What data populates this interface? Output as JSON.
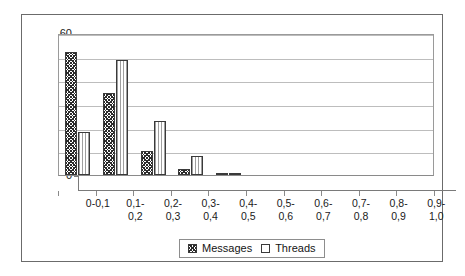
{
  "chart_data": {
    "type": "bar",
    "title": "",
    "xlabel": "",
    "ylabel": "",
    "ylim": [
      0,
      60
    ],
    "ytick_step": 10,
    "yticks": [
      "0",
      "10",
      "20",
      "30",
      "40",
      "50",
      "60"
    ],
    "grid": true,
    "legend_position": "bottom",
    "categories": [
      "0-0,1",
      "0,1-\n0,2",
      "0,2-\n0,3",
      "0,3-\n0,4",
      "0,4-\n0,5",
      "0,5-\n0,6",
      "0,6-\n0,7",
      "0,7-\n0,8",
      "0,8-\n0,9",
      "0,9-\n1,0"
    ],
    "series": [
      {
        "name": "Messages",
        "pattern": "diagonal-crosshatch",
        "values": [
          52,
          34.5,
          10,
          2.5,
          0.5,
          0,
          0,
          0,
          0,
          0
        ]
      },
      {
        "name": "Threads",
        "pattern": "dotted-white",
        "values": [
          18,
          48.5,
          23,
          8,
          1,
          0,
          0,
          0,
          0,
          0
        ]
      }
    ]
  },
  "legend": {
    "entries": [
      {
        "label": "Messages"
      },
      {
        "label": "Threads"
      }
    ]
  },
  "colors": {
    "frame": "#6b6b6b",
    "plot_border": "#9a9a9a",
    "gridline": "#bdbdbd",
    "axis": "#7a7a7a",
    "bar_outline": "#3a3a3a",
    "text": "#1a1a1a",
    "background": "#ffffff"
  }
}
